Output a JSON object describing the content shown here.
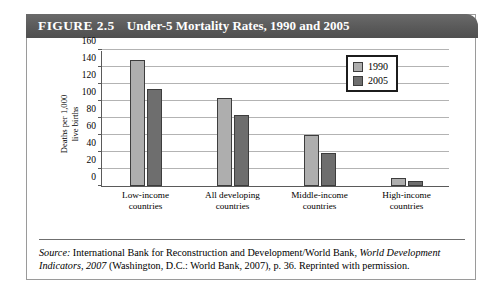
{
  "figure": {
    "number": "FIGURE 2.5",
    "title": "Under-5 Mortality Rates, 1990 and 2005"
  },
  "source": {
    "label": "Source:",
    "text_part1": " International Bank for Reconstruction and Development/World Bank, ",
    "italic_title": "World Development Indicators, 2007",
    "text_part2": " (Washington, D.C.: World Bank, 2007), p. 36. Reprinted with permission."
  },
  "colors": {
    "banner": "#5a5a5a",
    "series_1990": "#aeaeae",
    "series_2005": "#6e6e6e",
    "gridline": "#b3b3b3",
    "axis": "#5a5a5a"
  },
  "chart_data": {
    "type": "bar",
    "title": "Under-5 Mortality Rates, 1990 and 2005",
    "xlabel": "",
    "ylabel": "Deaths per 1,000 live births",
    "ylabel_lines": [
      "Deaths per 1,000",
      "live births"
    ],
    "ylim": [
      0,
      160
    ],
    "ytick_step": 20,
    "yticks": [
      0,
      20,
      40,
      60,
      80,
      100,
      120,
      140,
      160
    ],
    "grid": true,
    "legend_position": "top-right",
    "categories": [
      "Low-income countries",
      "All developing countries",
      "Middle-income countries",
      "High-income countries"
    ],
    "category_lines": [
      [
        "Low-income",
        "countries"
      ],
      [
        "All developing",
        "countries"
      ],
      [
        "Middle-income",
        "countries"
      ],
      [
        "High-income",
        "countries"
      ]
    ],
    "series": [
      {
        "name": "1990",
        "values": [
          148,
          104,
          60,
          10
        ]
      },
      {
        "name": "2005",
        "values": [
          114,
          83,
          39,
          6
        ]
      }
    ]
  }
}
